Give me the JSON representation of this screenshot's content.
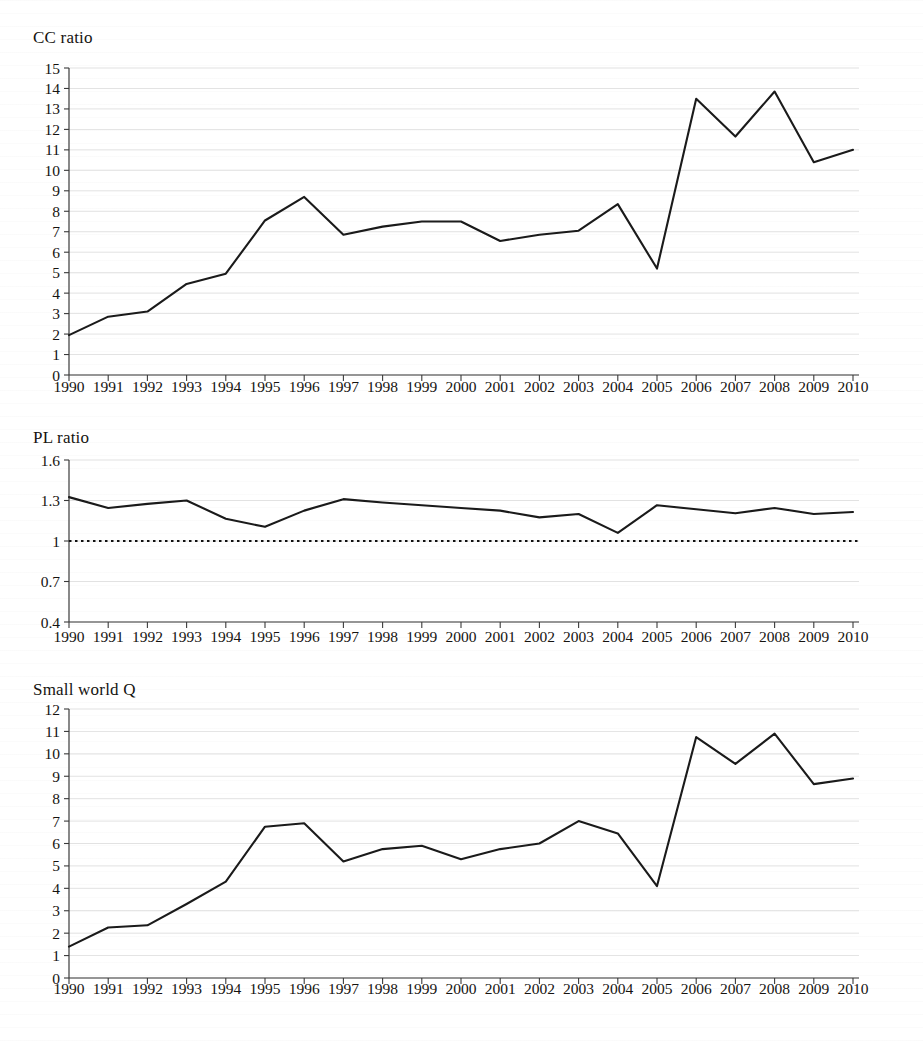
{
  "page": {
    "background": "#ffffff",
    "ink": "#15130f",
    "line_color": "#1a1a1a",
    "grid_color": "#cfcfcf"
  },
  "years": [
    "1990",
    "1991",
    "1992",
    "1993",
    "1994",
    "1995",
    "1996",
    "1997",
    "1998",
    "1999",
    "2000",
    "2001",
    "2002",
    "2003",
    "2004",
    "2005",
    "2006",
    "2007",
    "2008",
    "2009",
    "2010"
  ],
  "panels": [
    {
      "key": "cc_ratio",
      "title": "CC ratio"
    },
    {
      "key": "pl_ratio",
      "title": "PL ratio"
    },
    {
      "key": "small_world",
      "title": "Small world Q"
    }
  ],
  "chart_data": [
    {
      "type": "line",
      "title": "CC ratio",
      "xlabel": "",
      "ylabel": "CC ratio",
      "grid": true,
      "legend": "none",
      "x": [
        "1990",
        "1991",
        "1992",
        "1993",
        "1994",
        "1995",
        "1996",
        "1997",
        "1998",
        "1999",
        "2000",
        "2001",
        "2002",
        "2003",
        "2004",
        "2005",
        "2006",
        "2007",
        "2008",
        "2009",
        "2010"
      ],
      "values": [
        1.95,
        2.85,
        3.1,
        4.45,
        4.95,
        7.55,
        8.7,
        6.85,
        7.25,
        7.5,
        7.5,
        6.55,
        6.85,
        7.05,
        7.1,
        8.35,
        6.6,
        5.2,
        13.5,
        11.65,
        13.85,
        10.4,
        11.0
      ],
      "series_values": [
        1.95,
        2.85,
        3.1,
        4.45,
        4.95,
        7.55,
        8.7,
        6.85,
        7.25,
        7.5,
        7.5,
        6.55,
        6.85,
        7.05,
        8.35,
        5.2,
        13.5,
        11.65,
        13.85,
        10.4,
        11.0
      ],
      "yticks": [
        0,
        1,
        2,
        3,
        4,
        5,
        6,
        7,
        8,
        9,
        10,
        11,
        12,
        13,
        14,
        15
      ],
      "ytick_labels": [
        "0",
        "1",
        "2",
        "3",
        "4",
        "5",
        "6",
        "7",
        "8",
        "9",
        "10",
        "11",
        "12",
        "13",
        "14",
        "15"
      ],
      "ylim": [
        0,
        15
      ],
      "reference_line": null
    },
    {
      "type": "line",
      "title": "PL ratio",
      "xlabel": "",
      "ylabel": "PL ratio",
      "grid": true,
      "legend": "none",
      "x": [
        "1990",
        "1991",
        "1992",
        "1993",
        "1994",
        "1995",
        "1996",
        "1997",
        "1998",
        "1999",
        "2000",
        "2001",
        "2002",
        "2003",
        "2004",
        "2005",
        "2006",
        "2007",
        "2008",
        "2009",
        "2010"
      ],
      "series_values": [
        1.325,
        1.245,
        1.275,
        1.3,
        1.165,
        1.105,
        1.225,
        1.31,
        1.285,
        1.265,
        1.245,
        1.225,
        1.175,
        1.2,
        1.06,
        1.265,
        1.235,
        1.205,
        1.245,
        1.2,
        1.215
      ],
      "yticks": [
        0.4,
        0.7,
        1.0,
        1.3,
        1.6
      ],
      "ytick_labels": [
        "0.4",
        "0.7",
        "1",
        "1.3",
        "1.6"
      ],
      "ylim": [
        0.4,
        1.6
      ],
      "reference_line": {
        "y": 1.0,
        "style": "dotted"
      }
    },
    {
      "type": "line",
      "title": "Small world Q",
      "xlabel": "",
      "ylabel": "Small world Q",
      "grid": true,
      "legend": "none",
      "x": [
        "1990",
        "1991",
        "1992",
        "1993",
        "1994",
        "1995",
        "1996",
        "1997",
        "1998",
        "1999",
        "2000",
        "2001",
        "2002",
        "2003",
        "2004",
        "2005",
        "2006",
        "2007",
        "2008",
        "2009",
        "2010"
      ],
      "series_values": [
        1.4,
        2.25,
        2.35,
        3.3,
        4.3,
        6.75,
        6.9,
        5.2,
        5.75,
        5.9,
        5.3,
        5.75,
        6.0,
        7.0,
        6.45,
        4.1,
        10.75,
        9.55,
        10.9,
        8.65,
        8.9
      ],
      "yticks": [
        0,
        1,
        2,
        3,
        4,
        5,
        6,
        7,
        8,
        9,
        10,
        11,
        12
      ],
      "ytick_labels": [
        "0",
        "1",
        "2",
        "3",
        "4",
        "5",
        "6",
        "7",
        "8",
        "9",
        "10",
        "11",
        "12"
      ],
      "ylim": [
        0,
        12
      ],
      "reference_line": null
    }
  ]
}
